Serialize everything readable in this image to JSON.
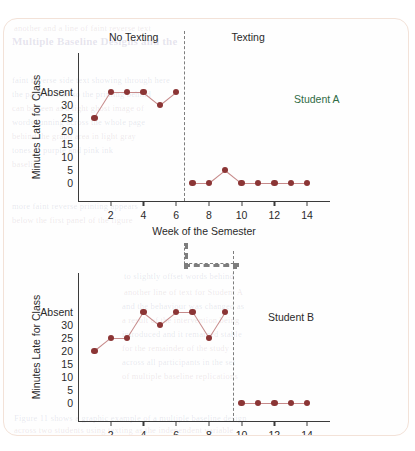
{
  "page": {
    "border_color": "#f3e2d8",
    "bleed_lines": [
      {
        "x": 10,
        "y": 4,
        "text": "another and a line of faint reverse text",
        "cls": "bleed"
      },
      {
        "x": 8,
        "y": 16,
        "text": "Multiple Baseline Designs and the",
        "cls": "bleed big"
      },
      {
        "x": 8,
        "y": 56,
        "text": "faint reverse side text showing through here",
        "cls": "bleed b2"
      },
      {
        "x": 8,
        "y": 70,
        "text": "the paper is thin so the printing behind",
        "cls": "bleed b2"
      },
      {
        "x": 8,
        "y": 84,
        "text": "can be seen as a light ghost image of",
        "cls": "bleed"
      },
      {
        "x": 8,
        "y": 98,
        "text": "words running across the whole page",
        "cls": "bleed b2"
      },
      {
        "x": 8,
        "y": 112,
        "text": "behind the graph area in light gray",
        "cls": "bleed"
      },
      {
        "x": 8,
        "y": 126,
        "text": "tones of purple and pink ink",
        "cls": "bleed b2"
      },
      {
        "x": 8,
        "y": 140,
        "text": "baseline",
        "cls": "bleed"
      },
      {
        "x": 8,
        "y": 182,
        "text": "more faint reverse printing appears",
        "cls": "bleed b2"
      },
      {
        "x": 8,
        "y": 196,
        "text": "below the first panel of the figure",
        "cls": "bleed"
      },
      {
        "x": 120,
        "y": 252,
        "text": "to slightly offset words behind",
        "cls": "bleed b2"
      },
      {
        "x": 120,
        "y": 268,
        "text": "another line of text for Student A",
        "cls": "bleed"
      },
      {
        "x": 118,
        "y": 282,
        "text": "and the behaviour was changed as",
        "cls": "bleed b2"
      },
      {
        "x": 118,
        "y": 296,
        "text": "a result of the intervention being",
        "cls": "bleed"
      },
      {
        "x": 118,
        "y": 310,
        "text": "introduced and it remained stable",
        "cls": "bleed b2"
      },
      {
        "x": 118,
        "y": 324,
        "text": "for the remainder of the study",
        "cls": "bleed"
      },
      {
        "x": 118,
        "y": 338,
        "text": "across all participants in the set",
        "cls": "bleed b2"
      },
      {
        "x": 118,
        "y": 352,
        "text": "of multiple baseline replications",
        "cls": "bleed"
      },
      {
        "x": 10,
        "y": 394,
        "text": "Figure 11 shows a graphic example of a multiple baseline design",
        "cls": "bleed b2"
      },
      {
        "x": 10,
        "y": 406,
        "text": "across two students using texting as the independent variable",
        "cls": "bleed"
      }
    ]
  },
  "chart_data": [
    {
      "id": "student-a",
      "type": "line",
      "title": "",
      "series_label": "Student A",
      "series_label_color": "#2f6b45",
      "xlabel": "Week of the Semester",
      "ylabel": "Minutes Late for Class",
      "ytick_labels": [
        "Absent",
        "30",
        "25",
        "20",
        "15",
        "10",
        "5",
        "0"
      ],
      "ytick_values": [
        35,
        30,
        25,
        20,
        15,
        10,
        5,
        0
      ],
      "ylim": [
        0,
        35
      ],
      "xlim": [
        0,
        15.4
      ],
      "xtick_labels": [
        "2",
        "4",
        "6",
        "8",
        "10",
        "12",
        "14"
      ],
      "xtick_values": [
        2,
        4,
        6,
        8,
        10,
        12,
        14
      ],
      "grid": false,
      "phase_change_x": 6.5,
      "phases": [
        {
          "label": "No Texting",
          "center_x": 3.4
        },
        {
          "label": "Texting",
          "center_x": 10.4
        }
      ],
      "phase_segments": [
        {
          "x": [
            1,
            2,
            3,
            4,
            5,
            6
          ],
          "y": [
            25,
            35,
            35,
            35,
            30,
            35
          ],
          "labels": [
            "25",
            "Absent",
            "Absent",
            "Absent",
            "30",
            "Absent"
          ]
        },
        {
          "x": [
            7,
            8,
            9,
            10,
            11,
            12,
            13,
            14
          ],
          "y": [
            0,
            0,
            5,
            0,
            0,
            0,
            0,
            0
          ],
          "labels": [
            "0",
            "0",
            "5",
            "0",
            "0",
            "0",
            "0",
            "0"
          ]
        }
      ]
    },
    {
      "id": "student-b",
      "type": "line",
      "title": "",
      "series_label": "Student B",
      "series_label_color": "#2a2a2a",
      "xlabel": "Week of the Semester",
      "ylabel": "Minutes Late for Class",
      "ytick_labels": [
        "Absent",
        "30",
        "25",
        "20",
        "15",
        "10",
        "5",
        "0"
      ],
      "ytick_values": [
        35,
        30,
        25,
        20,
        15,
        10,
        5,
        0
      ],
      "ylim": [
        0,
        35
      ],
      "xlim": [
        0,
        15.4
      ],
      "xtick_labels": [
        "2",
        "4",
        "6",
        "8",
        "10",
        "12",
        "14"
      ],
      "xtick_values": [
        2,
        4,
        6,
        8,
        10,
        12,
        14
      ],
      "grid": false,
      "phase_change_x": 9.5,
      "phases": [],
      "phase_segments": [
        {
          "x": [
            1,
            2,
            3,
            4,
            5,
            6,
            7,
            8,
            9
          ],
          "y": [
            20,
            25,
            25,
            35,
            30,
            35,
            35,
            25,
            35
          ],
          "labels": [
            "20",
            "25",
            "25",
            "Absent",
            "30",
            "Absent",
            "Absent",
            "25",
            "Absent"
          ]
        },
        {
          "x": [
            10,
            11,
            12,
            13,
            14
          ],
          "y": [
            0,
            0,
            0,
            0,
            0
          ],
          "labels": [
            "0",
            "0",
            "0",
            "0",
            "0"
          ]
        }
      ]
    }
  ],
  "marker_color": "#8b3535",
  "line_color": "#c68a8a",
  "phase_line_color": "#7d7d7d"
}
